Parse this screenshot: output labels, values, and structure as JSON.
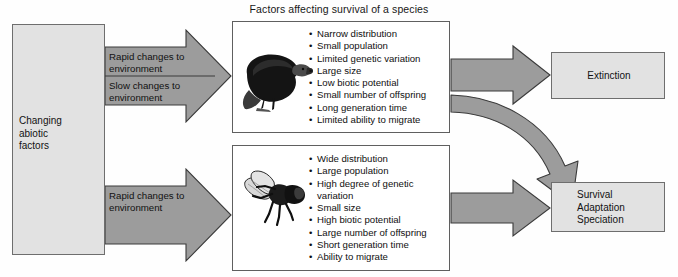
{
  "title": "Factors affecting survival of a species",
  "colors": {
    "arrow_fill": "#9c9c9c",
    "arrow_stroke": "#3c3c3c",
    "box_fill": "#e2e2e2",
    "box_stroke": "#6e6e6e",
    "panel_fill": "#ffffff",
    "panel_stroke": "#5f5f5f",
    "background": "#fefefe",
    "text": "#111111"
  },
  "left_box": {
    "label": "Changing\nabiotic\nfactors"
  },
  "arrows": {
    "rapid_top": "Rapid changes to\nenvironment",
    "slow": "Slow changes to\nenvironment",
    "rapid_bottom": "Rapid changes to\nenvironment"
  },
  "panels": [
    {
      "id": "top",
      "organism": "vulture-illustration",
      "factors": [
        "Narrow distribution",
        "Small population",
        "Limited genetic variation",
        "Large size",
        "Low biotic potential",
        "Small number of offspring",
        "Long generation time",
        "Limited ability to migrate"
      ]
    },
    {
      "id": "bottom",
      "organism": "fly-illustration",
      "factors": [
        "Wide distribution",
        "Large population",
        "High degree of genetic\n  variation",
        "Small size",
        "High biotic potential",
        "Large number of offspring",
        "Short generation time",
        "Ability to migrate"
      ]
    }
  ],
  "outcomes": {
    "extinction": "Extinction",
    "survival": "Survival\nAdaptation\nSpeciation"
  }
}
